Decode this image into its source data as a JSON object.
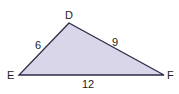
{
  "figure": {
    "type": "triangle",
    "fill_color": "#d9d6ea",
    "stroke_color": "#2b2b45",
    "vertices": [
      {
        "name": "D",
        "x": 69,
        "y": 23
      },
      {
        "name": "E",
        "x": 19,
        "y": 75
      },
      {
        "name": "F",
        "x": 164,
        "y": 75
      }
    ],
    "points": "69,23 19,75 164,75",
    "labels": {
      "D": "D",
      "E": "E",
      "F": "F"
    },
    "sides": {
      "DE": "6",
      "DF": "9",
      "EF": "12"
    }
  }
}
